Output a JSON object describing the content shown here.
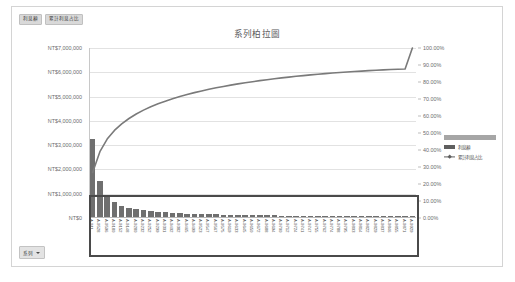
{
  "field_buttons": [
    {
      "label": "利息額"
    },
    {
      "label": "累計利息占比"
    }
  ],
  "chart": {
    "title": "系列柏拉圖"
  },
  "series_filter": {
    "label": "系列",
    "caret_icon": "chevron-down-icon"
  },
  "legend": {
    "position": "right",
    "items": [
      {
        "label": "利息額",
        "marker": "bar",
        "color": "#5f5f5f"
      },
      {
        "label": "累計利息占比",
        "marker": "line-marker",
        "color": "#5f5f5f"
      }
    ]
  },
  "colors": {
    "bar": "#6f6f6f",
    "line": "#7a7a7a",
    "grid": "#e2e2e2",
    "frame": "#d4d4d4",
    "annotation": "#4a4a4a",
    "text": "#595959"
  },
  "chart_data": {
    "type": "bar",
    "title": "系列柏拉圖",
    "xlabel": "",
    "ylabel": "",
    "grid": true,
    "legend_position": "right",
    "y_left": {
      "label": "利息額",
      "ylim": [
        0,
        7000000
      ],
      "ticks": [
        0,
        1000000,
        2000000,
        3000000,
        4000000,
        5000000,
        6000000,
        7000000
      ],
      "ticklabels": [
        "NT$0",
        "NT$1,000,000",
        "NT$2,000,000",
        "NT$3,000,000",
        "NT$4,000,000",
        "NT$5,000,000",
        "NT$6,000,000",
        "NT$7,000,000"
      ]
    },
    "y_right": {
      "label": "累計利息占比",
      "ylim": [
        0,
        1
      ],
      "ticks": [
        0,
        0.1,
        0.2,
        0.3,
        0.4,
        0.5,
        0.6,
        0.7,
        0.8,
        0.9,
        1.0
      ],
      "ticklabels": [
        "0.00%",
        "10.00%",
        "20.00%",
        "30.00%",
        "40.00%",
        "50.00%",
        "60.00%",
        "70.00%",
        "80.00%",
        "90.00%",
        "100.00%"
      ]
    },
    "categories": [
      "A-911",
      "A-9528",
      "A-9596",
      "A-9180",
      "A-9152",
      "A-9148",
      "A-9280",
      "A-9232",
      "A-9252",
      "A-9299",
      "A-9301",
      "A-9402",
      "A-9382",
      "A-9465",
      "A-9499",
      "A-9523",
      "A-9547",
      "A-9567",
      "A-9575",
      "A-9619",
      "A-9633",
      "A-9645",
      "A-9650",
      "A-9672",
      "A-9688",
      "A-9694",
      "A-9700",
      "A-9712",
      "A-9724",
      "A-9741",
      "A-9747",
      "A-9755",
      "A-9762",
      "A-9774",
      "A-9788",
      "A-9795",
      "A-9803",
      "A-9814",
      "A-9822",
      "A-9829",
      "A-9837",
      "A-9846",
      "A-9855",
      "A-9871",
      "A-9929"
    ],
    "series": [
      {
        "name": "利息額",
        "type": "bar",
        "axis": "left",
        "values": [
          3250000,
          1480000,
          900000,
          620000,
          470000,
          380000,
          320000,
          275000,
          240000,
          212000,
          190000,
          172000,
          157000,
          144000,
          133000,
          123000,
          114000,
          106000,
          99000,
          93000,
          87000,
          82000,
          77000,
          73000,
          69000,
          65000,
          62000,
          58000,
          55000,
          52000,
          49000,
          46000,
          44000,
          41000,
          39000,
          37000,
          34000,
          32000,
          30000,
          28000,
          26000,
          24000,
          21000,
          18000,
          14000
        ]
      },
      {
        "name": "累計利息占比",
        "type": "line",
        "axis": "right",
        "values": [
          0.268,
          0.39,
          0.4642,
          0.5153,
          0.5541,
          0.5854,
          0.6118,
          0.6345,
          0.6543,
          0.6718,
          0.6874,
          0.7016,
          0.7146,
          0.7265,
          0.7374,
          0.7476,
          0.757,
          0.7657,
          0.7739,
          0.7816,
          0.7888,
          0.7955,
          0.8019,
          0.8079,
          0.8136,
          0.819,
          0.8241,
          0.8289,
          0.8334,
          0.8377,
          0.8417,
          0.8455,
          0.8491,
          0.8525,
          0.8557,
          0.8588,
          0.8616,
          0.8642,
          0.8667,
          0.869,
          0.8711,
          0.8731,
          0.8749,
          0.8763,
          1.0
        ]
      }
    ],
    "annotations": [
      {
        "type": "rectangle",
        "name": "highlight-rectangle",
        "description": "dark rectangle outlining the low-value tail region"
      }
    ]
  }
}
